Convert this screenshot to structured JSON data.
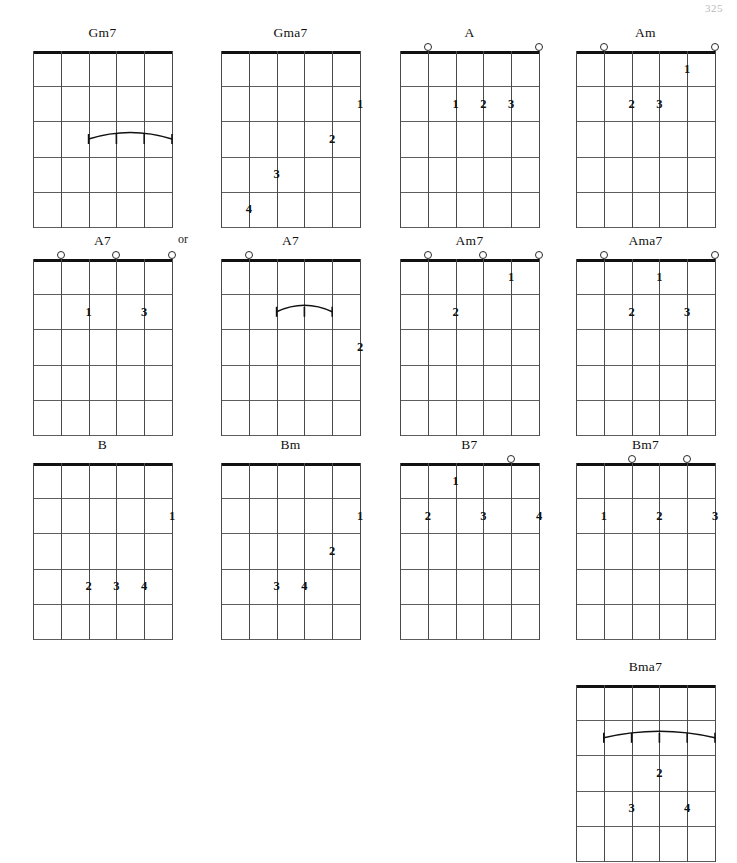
{
  "page": {
    "number": "325",
    "or_label": "or",
    "or_x": 178,
    "or_y": 232
  },
  "layout": {
    "grid_width": 139,
    "grid_height": 176,
    "strings": 6,
    "frets": 5
  },
  "chords": [
    {
      "name": "Gm7",
      "x": 33,
      "y": 24,
      "open_strings": [],
      "fingers": [],
      "barres": [
        {
          "fret": 3,
          "from_string": 3,
          "to_string": 6,
          "label": "1",
          "end_labels": [
            "1",
            "1",
            "1",
            "1"
          ]
        }
      ]
    },
    {
      "name": "Gma7",
      "x": 221,
      "y": 24,
      "open_strings": [],
      "fingers": [
        {
          "string": 6,
          "fret": 2,
          "label": "1"
        },
        {
          "string": 5,
          "fret": 3,
          "label": "2"
        },
        {
          "string": 3,
          "fret": 4,
          "label": "3"
        },
        {
          "string": 2,
          "fret": 5,
          "label": "4"
        }
      ],
      "barres": []
    },
    {
      "name": "A",
      "x": 400,
      "y": 24,
      "open_strings": [
        2,
        6
      ],
      "fingers": [
        {
          "string": 3,
          "fret": 2,
          "label": "1"
        },
        {
          "string": 4,
          "fret": 2,
          "label": "2"
        },
        {
          "string": 5,
          "fret": 2,
          "label": "3"
        }
      ],
      "barres": []
    },
    {
      "name": "Am",
      "x": 576,
      "y": 24,
      "open_strings": [
        2,
        6
      ],
      "fingers": [
        {
          "string": 5,
          "fret": 1,
          "label": "1"
        },
        {
          "string": 3,
          "fret": 2,
          "label": "2"
        },
        {
          "string": 4,
          "fret": 2,
          "label": "3"
        }
      ],
      "barres": []
    },
    {
      "name": "A7",
      "x": 33,
      "y": 232,
      "open_strings": [
        2,
        4,
        6
      ],
      "fingers": [
        {
          "string": 3,
          "fret": 2,
          "label": "1"
        },
        {
          "string": 5,
          "fret": 2,
          "label": "3"
        }
      ],
      "barres": []
    },
    {
      "name": "A7",
      "x": 221,
      "y": 232,
      "open_strings": [
        2
      ],
      "fingers": [
        {
          "string": 6,
          "fret": 3,
          "label": "2"
        }
      ],
      "barres": [
        {
          "fret": 2,
          "from_string": 3,
          "to_string": 5,
          "label": "1",
          "end_labels": [
            "1",
            "1",
            "1"
          ]
        }
      ]
    },
    {
      "name": "Am7",
      "x": 400,
      "y": 232,
      "open_strings": [
        2,
        4,
        6
      ],
      "fingers": [
        {
          "string": 5,
          "fret": 1,
          "label": "1"
        },
        {
          "string": 3,
          "fret": 2,
          "label": "2"
        }
      ],
      "barres": []
    },
    {
      "name": "Ama7",
      "x": 576,
      "y": 232,
      "open_strings": [
        2,
        6
      ],
      "fingers": [
        {
          "string": 4,
          "fret": 1,
          "label": "1"
        },
        {
          "string": 3,
          "fret": 2,
          "label": "2"
        },
        {
          "string": 5,
          "fret": 2,
          "label": "3"
        }
      ],
      "barres": []
    },
    {
      "name": "B",
      "x": 33,
      "y": 436,
      "open_strings": [],
      "fingers": [
        {
          "string": 6,
          "fret": 2,
          "label": "1"
        },
        {
          "string": 3,
          "fret": 4,
          "label": "2"
        },
        {
          "string": 4,
          "fret": 4,
          "label": "3"
        },
        {
          "string": 5,
          "fret": 4,
          "label": "4"
        }
      ],
      "barres": []
    },
    {
      "name": "Bm",
      "x": 221,
      "y": 436,
      "open_strings": [],
      "fingers": [
        {
          "string": 6,
          "fret": 2,
          "label": "1"
        },
        {
          "string": 5,
          "fret": 3,
          "label": "2"
        },
        {
          "string": 3,
          "fret": 4,
          "label": "3"
        },
        {
          "string": 4,
          "fret": 4,
          "label": "4"
        }
      ],
      "barres": []
    },
    {
      "name": "B7",
      "x": 400,
      "y": 436,
      "open_strings": [
        5
      ],
      "fingers": [
        {
          "string": 3,
          "fret": 1,
          "label": "1"
        },
        {
          "string": 2,
          "fret": 2,
          "label": "2"
        },
        {
          "string": 4,
          "fret": 2,
          "label": "3"
        },
        {
          "string": 6,
          "fret": 2,
          "label": "4"
        }
      ],
      "barres": []
    },
    {
      "name": "Bm7",
      "x": 576,
      "y": 436,
      "open_strings": [
        3,
        5
      ],
      "fingers": [
        {
          "string": 2,
          "fret": 2,
          "label": "1"
        },
        {
          "string": 4,
          "fret": 2,
          "label": "2"
        },
        {
          "string": 6,
          "fret": 2,
          "label": "3"
        }
      ],
      "barres": []
    },
    {
      "name": "Bma7",
      "x": 576,
      "y": 658,
      "open_strings": [],
      "fingers": [
        {
          "string": 4,
          "fret": 3,
          "label": "2"
        },
        {
          "string": 3,
          "fret": 4,
          "label": "3"
        },
        {
          "string": 5,
          "fret": 4,
          "label": "4"
        }
      ],
      "barres": [
        {
          "fret": 2,
          "from_string": 2,
          "to_string": 6,
          "label": "1",
          "end_labels": [
            "1",
            "1"
          ]
        }
      ]
    }
  ]
}
